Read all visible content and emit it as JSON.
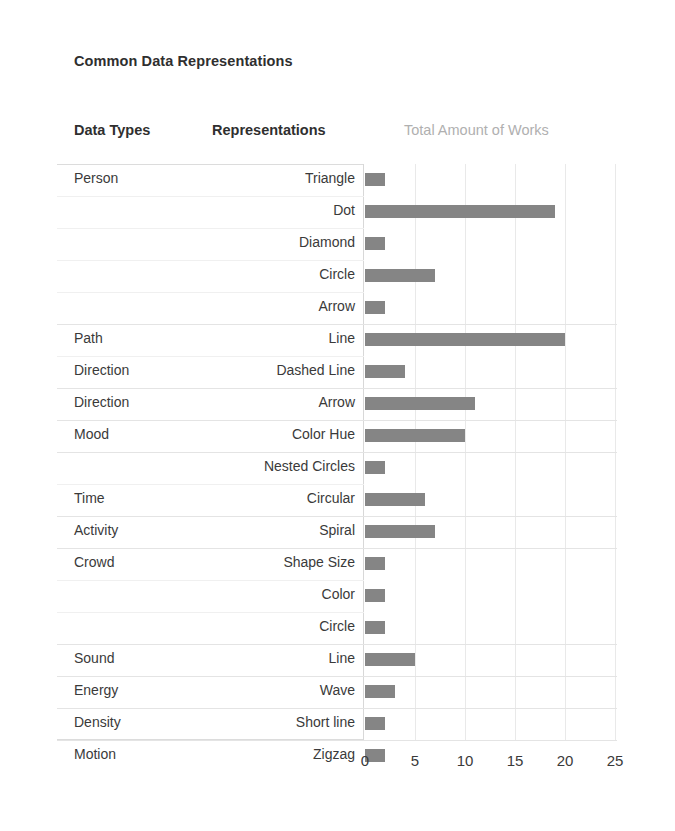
{
  "chart_data": {
    "type": "bar",
    "orientation": "horizontal",
    "title": "Common Data Representations",
    "xlabel": "",
    "ylabel": "",
    "xlim": [
      0,
      25
    ],
    "xticks": [
      0,
      5,
      10,
      15,
      20,
      25
    ],
    "grid": "vertical-only",
    "legend": "none",
    "bar_color": "#858585",
    "columns": [
      "Data Types",
      "Representations",
      "Total Amount of Works"
    ],
    "categories": [
      "Triangle",
      "Dot",
      "Diamond",
      "Circle",
      "Arrow",
      "Line",
      "Dashed Line",
      "Arrow",
      "Color Hue",
      "Nested Circles",
      "Circular",
      "Spiral",
      "Shape Size",
      "Color",
      "Circle",
      "Line",
      "Wave",
      "Short line",
      "Zigzag"
    ],
    "values": [
      2,
      19,
      2,
      7,
      2,
      20,
      4,
      11,
      10,
      2,
      6,
      7,
      2,
      2,
      2,
      5,
      3,
      2,
      2
    ],
    "groups": [
      {
        "data_type": "Person",
        "representations": [
          "Triangle",
          "Dot",
          "Diamond",
          "Circle",
          "Arrow"
        ],
        "values": [
          2,
          19,
          2,
          7,
          2
        ]
      },
      {
        "data_type": "Path Direction",
        "representations": [
          "Line",
          "Dashed Line"
        ],
        "values": [
          20,
          4
        ]
      },
      {
        "data_type": "Direction",
        "representations": [
          "Arrow"
        ],
        "values": [
          11
        ]
      },
      {
        "data_type": "Mood",
        "representations": [
          "Color Hue"
        ],
        "values": [
          10
        ]
      },
      {
        "data_type": "Time",
        "representations": [
          "Nested Circles",
          "Circular"
        ],
        "values": [
          2,
          6
        ]
      },
      {
        "data_type": "Activity",
        "representations": [
          "Spiral"
        ],
        "values": [
          7
        ]
      },
      {
        "data_type": "Crowd",
        "representations": [
          "Shape Size",
          "Color",
          "Circle"
        ],
        "values": [
          2,
          2,
          2
        ]
      },
      {
        "data_type": "Sound",
        "representations": [
          "Line"
        ],
        "values": [
          5
        ]
      },
      {
        "data_type": "Energy",
        "representations": [
          "Wave"
        ],
        "values": [
          3
        ]
      },
      {
        "data_type": "Density",
        "representations": [
          "Short line"
        ],
        "values": [
          2
        ]
      },
      {
        "data_type": "Motion",
        "representations": [
          "Zigzag"
        ],
        "values": [
          2
        ]
      }
    ]
  },
  "header": {
    "title": "Common Data Representations",
    "col_data_types": "Data Types",
    "col_representations": "Representations",
    "col_total": "Total Amount of Works"
  },
  "rows": [
    {
      "data_type": "Person",
      "data_type_line2": "",
      "representation": "Triangle",
      "value": 2,
      "group_start": true
    },
    {
      "data_type": "",
      "data_type_line2": "",
      "representation": "Dot",
      "value": 19,
      "group_start": false
    },
    {
      "data_type": "",
      "data_type_line2": "",
      "representation": "Diamond",
      "value": 2,
      "group_start": false
    },
    {
      "data_type": "",
      "data_type_line2": "",
      "representation": "Circle",
      "value": 7,
      "group_start": false
    },
    {
      "data_type": "",
      "data_type_line2": "",
      "representation": "Arrow",
      "value": 2,
      "group_start": false
    },
    {
      "data_type": "Path",
      "data_type_line2": "",
      "representation": "Line",
      "value": 20,
      "group_start": true
    },
    {
      "data_type": "Direction",
      "data_type_line2": "",
      "representation": "Dashed Line",
      "value": 4,
      "group_start": false
    },
    {
      "data_type": "Direction",
      "data_type_line2": "",
      "representation": "Arrow",
      "value": 11,
      "group_start": true
    },
    {
      "data_type": "Mood",
      "data_type_line2": "",
      "representation": "Color Hue",
      "value": 10,
      "group_start": true
    },
    {
      "data_type": "",
      "data_type_line2": "",
      "representation": "Nested Circles",
      "value": 2,
      "group_start": true
    },
    {
      "data_type": "Time",
      "data_type_line2": "",
      "representation": "Circular",
      "value": 6,
      "group_start": false
    },
    {
      "data_type": "Activity",
      "data_type_line2": "",
      "representation": "Spiral",
      "value": 7,
      "group_start": true
    },
    {
      "data_type": "Crowd",
      "data_type_line2": "",
      "representation": "Shape Size",
      "value": 2,
      "group_start": true
    },
    {
      "data_type": "",
      "data_type_line2": "",
      "representation": "Color",
      "value": 2,
      "group_start": false
    },
    {
      "data_type": "",
      "data_type_line2": "",
      "representation": "Circle",
      "value": 2,
      "group_start": false
    },
    {
      "data_type": "Sound",
      "data_type_line2": "",
      "representation": "Line",
      "value": 5,
      "group_start": true
    },
    {
      "data_type": "Energy",
      "data_type_line2": "",
      "representation": "Wave",
      "value": 3,
      "group_start": true
    },
    {
      "data_type": "Density",
      "data_type_line2": "",
      "representation": "Short line",
      "value": 2,
      "group_start": true
    },
    {
      "data_type": "Motion",
      "data_type_line2": "",
      "representation": "Zigzag",
      "value": 2,
      "group_start": true
    }
  ],
  "axis": {
    "ticks": [
      "0",
      "5",
      "10",
      "15",
      "20",
      "25"
    ]
  },
  "colors": {
    "bar": "#858585",
    "text": "#3a3a3a",
    "header_muted": "#b0b0b0",
    "gridline": "#e9e9e9",
    "row_separator": "#e4e4e4"
  }
}
